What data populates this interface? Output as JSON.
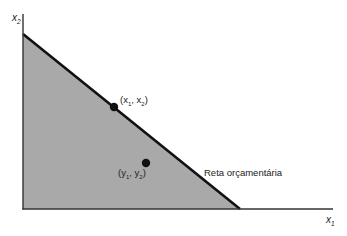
{
  "diagram": {
    "type": "budget-set",
    "axes": {
      "x_label": "x",
      "x_sub": "1",
      "y_label": "x",
      "y_sub": "2"
    },
    "budget_line": {
      "label": "Reta orçamentária",
      "color": "#111111"
    },
    "budget_set_fill": "#a8a8a8",
    "points": [
      {
        "id": "on-line",
        "label_open": "(x",
        "sub1": "1",
        "mid": ", x",
        "sub2": "2",
        "label_close": ")"
      },
      {
        "id": "inside",
        "label_open": "(y",
        "sub1": "1",
        "mid": ", y",
        "sub2": "2",
        "label_close": ")"
      }
    ]
  }
}
